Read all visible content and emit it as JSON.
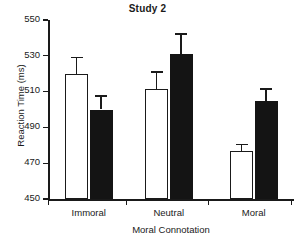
{
  "chart_data": {
    "type": "bar",
    "title": "Study 2",
    "xlabel": "Moral Connotation",
    "ylabel": "Reaction Time (ms)",
    "categories": [
      "Immoral",
      "Neutral",
      "Moral"
    ],
    "ylim": [
      450,
      550
    ],
    "yticks": [
      450,
      470,
      490,
      510,
      530,
      550
    ],
    "ytick_labels": [
      "450",
      "470",
      "490",
      "510",
      "530",
      "550"
    ],
    "grid": false,
    "legend": "none",
    "series": [
      {
        "name": "white-bars",
        "fill": "#ffffff",
        "edge": "#1a1a1a",
        "values": [
          520,
          511.5,
          477
        ],
        "errors": [
          9.5,
          10,
          4
        ]
      },
      {
        "name": "black-bars",
        "fill": "#141414",
        "edge": "#141414",
        "values": [
          500,
          531,
          505
        ],
        "errors": [
          8,
          11.5,
          7
        ]
      }
    ]
  },
  "colors": {
    "axis": "#1a1a1a",
    "white_bar": "#ffffff",
    "black_bar": "#141414",
    "background": "#ffffff"
  }
}
